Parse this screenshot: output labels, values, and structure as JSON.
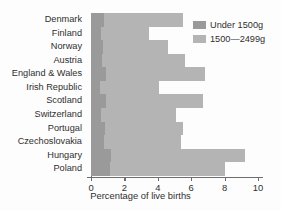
{
  "chart_data": {
    "type": "bar",
    "orientation": "horizontal",
    "stacked": true,
    "title": "",
    "xlabel": "Percentage of live births",
    "ylabel": "",
    "xlim": [
      0,
      10
    ],
    "xticks": [
      0,
      2,
      4,
      6,
      8,
      10
    ],
    "xtick_labels": [
      "0",
      "2",
      "4",
      "6",
      "8",
      "10"
    ],
    "grid": false,
    "legend_position": "top-right",
    "categories": [
      "Denmark",
      "Finland",
      "Norway",
      "Austria",
      "England & Wales",
      "Irish Republic",
      "Scotland",
      "Switzerland",
      "Portugal",
      "Czechoslovakia",
      "Hungary",
      "Poland"
    ],
    "series": [
      {
        "name": "Under 1500g",
        "color": "#9a9a9a",
        "values": [
          0.8,
          0.6,
          0.7,
          0.65,
          0.9,
          0.55,
          0.9,
          0.6,
          0.85,
          0.75,
          1.2,
          1.15
        ]
      },
      {
        "name": "1500—2499g",
        "color": "#b4b4b4",
        "values": [
          4.7,
          2.9,
          3.9,
          4.95,
          5.9,
          3.55,
          5.8,
          4.5,
          4.65,
          4.65,
          8.0,
          6.85
        ]
      }
    ],
    "totals": [
      5.5,
      3.5,
      4.6,
      5.6,
      6.8,
      4.1,
      6.7,
      5.1,
      5.5,
      5.4,
      9.2,
      8.0
    ]
  },
  "legend": {
    "entries": [
      {
        "label": "Under 1500g",
        "color": "#9a9a9a"
      },
      {
        "label": "1500—2499g",
        "color": "#b4b4b4"
      }
    ]
  },
  "axis": {
    "x_title": "Percentage of live births"
  },
  "colors": {
    "under_1500": "#9a9a9a",
    "range_1500_2499": "#b4b4b4",
    "axis": "#6e6e6e",
    "text": "#2f2f2f",
    "background": "#fdfdfd"
  }
}
